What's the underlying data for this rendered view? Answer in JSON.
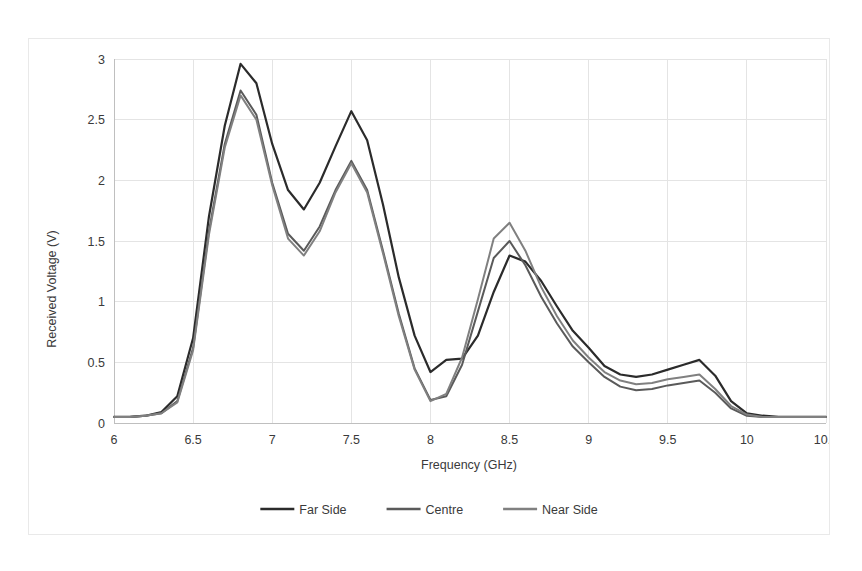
{
  "figure": {
    "background": "#ffffff",
    "border_color": "#e9e9e9"
  },
  "chart_data": {
    "type": "line",
    "title": "",
    "xlabel": "Frequency (GHz)",
    "ylabel": "Received Voltage (V)",
    "xlim": [
      6,
      10.5
    ],
    "ylim": [
      0,
      3
    ],
    "xticks": [
      "6",
      "6.5",
      "7",
      "7.5",
      "8",
      "8.5",
      "9",
      "9.5",
      "10",
      "10.5"
    ],
    "xtick_values": [
      6,
      6.5,
      7,
      7.5,
      8,
      8.5,
      9,
      9.5,
      10,
      10.5
    ],
    "yticks": [
      "0",
      "0.5",
      "1",
      "1.5",
      "2",
      "2.5",
      "3"
    ],
    "ytick_values": [
      0,
      0.5,
      1,
      1.5,
      2,
      2.5,
      3
    ],
    "grid": true,
    "grid_color": "#e4e4e4",
    "legend_position": "bottom",
    "x": [
      6.0,
      6.1,
      6.2,
      6.3,
      6.4,
      6.5,
      6.6,
      6.7,
      6.8,
      6.9,
      7.0,
      7.1,
      7.2,
      7.3,
      7.4,
      7.5,
      7.6,
      7.7,
      7.8,
      7.9,
      8.0,
      8.1,
      8.2,
      8.3,
      8.4,
      8.5,
      8.6,
      8.7,
      8.8,
      8.9,
      9.0,
      9.1,
      9.2,
      9.3,
      9.4,
      9.5,
      9.6,
      9.7,
      9.8,
      9.9,
      10.0,
      10.1,
      10.2,
      10.3,
      10.4,
      10.5
    ],
    "series": [
      {
        "name": "Far Side",
        "color": "#2b2b2b",
        "width": 2.2,
        "values": [
          0.05,
          0.05,
          0.06,
          0.09,
          0.22,
          0.7,
          1.7,
          2.45,
          2.96,
          2.8,
          2.3,
          1.92,
          1.76,
          1.98,
          2.28,
          2.57,
          2.33,
          1.8,
          1.2,
          0.72,
          0.42,
          0.52,
          0.53,
          0.72,
          1.08,
          1.38,
          1.33,
          1.17,
          0.96,
          0.76,
          0.62,
          0.47,
          0.4,
          0.38,
          0.4,
          0.44,
          0.48,
          0.52,
          0.39,
          0.18,
          0.08,
          0.06,
          0.05,
          0.05,
          0.05,
          0.05
        ]
      },
      {
        "name": "Centre",
        "color": "#5a5a5a",
        "width": 2.0,
        "values": [
          0.05,
          0.05,
          0.06,
          0.08,
          0.18,
          0.62,
          1.58,
          2.3,
          2.74,
          2.54,
          1.98,
          1.56,
          1.42,
          1.62,
          1.92,
          2.16,
          1.92,
          1.42,
          0.9,
          0.45,
          0.19,
          0.22,
          0.48,
          0.92,
          1.36,
          1.5,
          1.3,
          1.04,
          0.82,
          0.63,
          0.5,
          0.38,
          0.3,
          0.27,
          0.28,
          0.31,
          0.33,
          0.35,
          0.25,
          0.12,
          0.06,
          0.05,
          0.05,
          0.05,
          0.05,
          0.05
        ]
      },
      {
        "name": "Near Side",
        "color": "#808080",
        "width": 2.0,
        "values": [
          0.05,
          0.05,
          0.06,
          0.08,
          0.17,
          0.6,
          1.55,
          2.27,
          2.7,
          2.5,
          1.96,
          1.52,
          1.38,
          1.58,
          1.9,
          2.14,
          1.9,
          1.4,
          0.88,
          0.44,
          0.18,
          0.24,
          0.54,
          1.02,
          1.52,
          1.65,
          1.42,
          1.12,
          0.88,
          0.68,
          0.54,
          0.42,
          0.35,
          0.32,
          0.33,
          0.36,
          0.38,
          0.4,
          0.28,
          0.14,
          0.07,
          0.05,
          0.05,
          0.05,
          0.05,
          0.05
        ]
      }
    ]
  }
}
